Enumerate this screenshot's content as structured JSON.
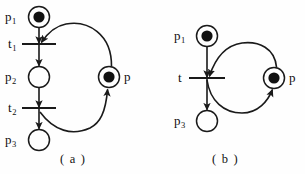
{
  "figure": {
    "type": "petri-net",
    "background_color": "#fefefe",
    "stroke_color": "#1a1a1a",
    "token_color": "#111111",
    "subfigures": [
      {
        "id": "a",
        "caption": "( a )",
        "caption_x": 72,
        "caption_y": 152,
        "places": [
          {
            "id": "p1",
            "label": "p",
            "subscript": "1",
            "cx": 39,
            "cy": 17,
            "r": 10.5,
            "tokens": 1,
            "label_x": 5,
            "label_y": 10
          },
          {
            "id": "p2",
            "label": "p",
            "subscript": "2",
            "cx": 39,
            "cy": 77,
            "r": 10.5,
            "tokens": 0,
            "label_x": 5,
            "label_y": 70
          },
          {
            "id": "p3",
            "label": "p",
            "subscript": "3",
            "cx": 39,
            "cy": 140,
            "r": 10.5,
            "tokens": 0,
            "label_x": 5,
            "label_y": 133
          },
          {
            "id": "pa",
            "label": "p",
            "subscript": "",
            "cx": 109,
            "cy": 77,
            "r": 10.5,
            "tokens": 1,
            "label_x": 124,
            "label_y": 70
          }
        ],
        "transitions": [
          {
            "id": "t1",
            "label": "t",
            "subscript": "1",
            "cx": 39,
            "cy": 44,
            "half_width": 17,
            "label_x": 8,
            "label_y": 38
          },
          {
            "id": "t2",
            "label": "t",
            "subscript": "2",
            "cx": 39,
            "cy": 108,
            "half_width": 17,
            "label_x": 8,
            "label_y": 102
          }
        ],
        "arcs": [
          {
            "from": "p1",
            "to": "t1",
            "kind": "straight-down"
          },
          {
            "from": "t1",
            "to": "p2",
            "kind": "straight-down"
          },
          {
            "from": "p2",
            "to": "t2",
            "kind": "straight-down"
          },
          {
            "from": "t2",
            "to": "p3",
            "kind": "straight-down"
          },
          {
            "from": "pa",
            "to": "t1",
            "kind": "curve-upper"
          },
          {
            "from": "t2",
            "to": "pa",
            "kind": "curve-lower"
          }
        ]
      },
      {
        "id": "b",
        "caption": "( b )",
        "caption_x": 222,
        "caption_y": 152,
        "places": [
          {
            "id": "p1",
            "label": "p",
            "subscript": "1",
            "cx": 207,
            "cy": 36,
            "r": 10.5,
            "tokens": 1,
            "label_x": 178,
            "label_y": 29
          },
          {
            "id": "p3",
            "label": "p",
            "subscript": "3",
            "cx": 207,
            "cy": 121,
            "r": 10.5,
            "tokens": 0,
            "label_x": 178,
            "label_y": 114
          },
          {
            "id": "pb",
            "label": "p",
            "subscript": "",
            "cx": 274,
            "cy": 78,
            "r": 10.5,
            "tokens": 1,
            "label_x": 289,
            "label_y": 71
          }
        ],
        "transitions": [
          {
            "id": "t",
            "label": "t",
            "subscript": "",
            "cx": 207,
            "cy": 78,
            "half_width": 18,
            "label_x": 179,
            "label_y": 72
          }
        ],
        "arcs": [
          {
            "from": "p1",
            "to": "t",
            "kind": "straight-down"
          },
          {
            "from": "t",
            "to": "p3",
            "kind": "straight-down"
          },
          {
            "from": "pb",
            "to": "t",
            "kind": "curve-upper"
          },
          {
            "from": "t",
            "to": "pb",
            "kind": "curve-lower"
          }
        ]
      }
    ]
  },
  "labels": {
    "a_p1": "p",
    "a_p1_sub": "1",
    "a_p2": "p",
    "a_p2_sub": "2",
    "a_p3": "p",
    "a_p3_sub": "3",
    "a_p": "p",
    "a_t1": "t",
    "a_t1_sub": "1",
    "a_t2": "t",
    "a_t2_sub": "2",
    "a_caption": "( a )",
    "b_p1": "p",
    "b_p1_sub": "1",
    "b_p3": "p",
    "b_p3_sub": "3",
    "b_p": "p",
    "b_t": "t",
    "b_caption": "( b )"
  }
}
